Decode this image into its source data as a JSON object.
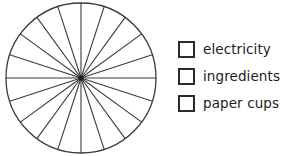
{
  "chart_data": {
    "type": "pie",
    "title": "",
    "subtitle": "",
    "xlabel": "",
    "ylabel": "",
    "grid": false,
    "legend_position": "right",
    "note": "Blank (unfilled) pie chart template divided into 20 equal sectors of 18 degrees each; no slice is shaded or assigned to a category.",
    "total_sectors": 20,
    "sector_degrees": 18,
    "sector_percent": 5,
    "categories": [
      "electricity",
      "ingredients",
      "paper cups"
    ],
    "values": [
      0,
      0,
      0
    ],
    "slice_colors": [
      "#ffffff",
      "#ffffff",
      "#ffffff"
    ],
    "outline_color": "#3a3a3a",
    "start_angle_degrees": 90
  },
  "chart": {
    "name": "blank-pie-chart",
    "center_x": 81,
    "center_y": 78,
    "radius": 75,
    "outline_color": "#3a3a3a",
    "spoke_color": "#3a3a3a",
    "fill_color": "#ffffff",
    "sectors": 20
  },
  "legend": {
    "items": [
      {
        "label": "electricity",
        "swatch_fill": "#ffffff",
        "swatch_border": "#2b2b2b",
        "checked": false
      },
      {
        "label": "ingredients",
        "swatch_fill": "#ffffff",
        "swatch_border": "#2b2b2b",
        "checked": false
      },
      {
        "label": "paper cups",
        "swatch_fill": "#ffffff",
        "swatch_border": "#2b2b2b",
        "checked": false
      }
    ]
  }
}
